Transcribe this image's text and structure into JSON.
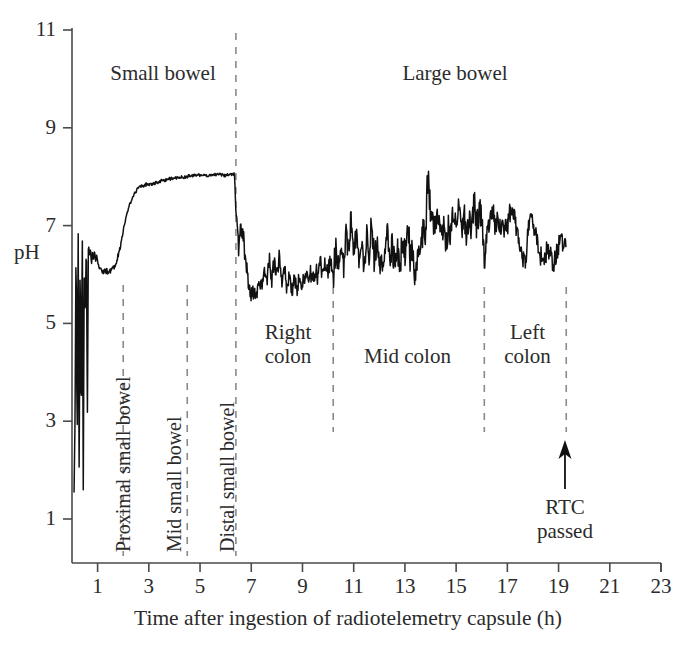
{
  "axes": {
    "y": {
      "label": "pH",
      "ticks": [
        1,
        3,
        5,
        7,
        9,
        11
      ],
      "min": 0.45,
      "max": 11.35
    },
    "x": {
      "label": "Time after ingestion of radiotelemetry capsule (h)",
      "ticks": [
        1,
        3,
        5,
        7,
        9,
        11,
        13,
        15,
        17,
        19,
        21,
        23
      ],
      "min": 0.0,
      "max": 23.0
    }
  },
  "top_regions": [
    {
      "name": "small-bowel",
      "label": "Small bowel"
    },
    {
      "name": "large-bowel",
      "label": "Large bowel"
    }
  ],
  "segment_labels": [
    {
      "name": "proximal-small-bowel",
      "label": "Proximal small bowel",
      "orientation": "vertical"
    },
    {
      "name": "mid-small-bowel",
      "label": "Mid small bowel",
      "orientation": "vertical"
    },
    {
      "name": "distal-small-bowel",
      "label": "Distal small bowel",
      "orientation": "vertical"
    },
    {
      "name": "right-colon",
      "label_line1": "Right",
      "label_line2": "colon",
      "orientation": "horizontal"
    },
    {
      "name": "mid-colon",
      "label_line1": "Mid colon",
      "label_line2": "",
      "orientation": "horizontal"
    },
    {
      "name": "left-colon",
      "label_line1": "Left",
      "label_line2": "colon",
      "orientation": "horizontal"
    }
  ],
  "annotation": {
    "name": "rtc-passed",
    "line1": "RTC",
    "line2": "passed",
    "arrow_at_hours": 19.25
  },
  "colors": {
    "background": "#ffffff",
    "trace": "#111111",
    "axis": "#4a4a4a",
    "divider": "#8a8a8a",
    "text": "#2b2b2b"
  },
  "chart_data": {
    "type": "line",
    "title": "",
    "xlabel": "Time after ingestion of radiotelemetry capsule (h)",
    "ylabel": "pH",
    "xlim": [
      0.0,
      23.0
    ],
    "ylim": [
      0.45,
      11.35
    ],
    "grid": false,
    "legend": null,
    "xticks": [
      1,
      3,
      5,
      7,
      9,
      11,
      13,
      15,
      17,
      19,
      21,
      23
    ],
    "yticks": [
      1,
      3,
      5,
      7,
      9,
      11
    ],
    "region_dividers_hours": [
      2.0,
      4.5,
      6.4,
      10.2,
      16.1,
      19.3
    ],
    "series": [
      {
        "name": "pH trace",
        "x": [
          0.08,
          0.12,
          0.16,
          0.2,
          0.24,
          0.28,
          0.32,
          0.36,
          0.4,
          0.44,
          0.48,
          0.52,
          0.56,
          0.6,
          0.64,
          0.68,
          0.72,
          0.76,
          0.8,
          0.84,
          0.88,
          0.92,
          0.96,
          1.0,
          1.1,
          1.2,
          1.3,
          1.4,
          1.5,
          1.6,
          1.7,
          1.8,
          1.9,
          2.0,
          2.1,
          2.2,
          2.3,
          2.4,
          2.5,
          2.6,
          2.7,
          2.8,
          2.9,
          3.0,
          3.2,
          3.4,
          3.6,
          3.8,
          4.0,
          4.2,
          4.4,
          4.6,
          4.8,
          5.0,
          5.2,
          5.4,
          5.6,
          5.8,
          6.0,
          6.2,
          6.35,
          6.4,
          6.45,
          6.5,
          6.6,
          6.7,
          6.8,
          6.9,
          7.0,
          7.1,
          7.2,
          7.3,
          7.4,
          7.5,
          7.6,
          7.7,
          7.8,
          7.9,
          8.0,
          8.1,
          8.2,
          8.3,
          8.4,
          8.5,
          8.6,
          8.7,
          8.8,
          8.9,
          9.0,
          9.1,
          9.2,
          9.3,
          9.4,
          9.5,
          9.6,
          9.7,
          9.8,
          9.9,
          10.0,
          10.1,
          10.2,
          10.3,
          10.4,
          10.5,
          10.6,
          10.7,
          10.8,
          10.9,
          11.0,
          11.1,
          11.2,
          11.3,
          11.4,
          11.5,
          11.6,
          11.7,
          11.8,
          11.9,
          12.0,
          12.1,
          12.2,
          12.3,
          12.4,
          12.5,
          12.6,
          12.7,
          12.8,
          12.9,
          13.0,
          13.1,
          13.2,
          13.3,
          13.4,
          13.5,
          13.6,
          13.7,
          13.8,
          13.9,
          14.0,
          14.1,
          14.2,
          14.3,
          14.4,
          14.5,
          14.6,
          14.7,
          14.8,
          14.9,
          15.0,
          15.1,
          15.2,
          15.3,
          15.4,
          15.5,
          15.6,
          15.7,
          15.8,
          15.9,
          16.0,
          16.1,
          16.2,
          16.3,
          16.4,
          16.5,
          16.6,
          16.7,
          16.8,
          16.9,
          17.0,
          17.1,
          17.2,
          17.3,
          17.4,
          17.5,
          17.6,
          17.7,
          17.8,
          17.9,
          18.0,
          18.1,
          18.2,
          18.3,
          18.4,
          18.5,
          18.6,
          18.7,
          18.8,
          18.9,
          19.0,
          19.1,
          19.2,
          19.3
        ],
        "y": [
          1.55,
          3.1,
          6.9,
          2.2,
          7.1,
          1.8,
          6.6,
          2.6,
          7.25,
          1.6,
          6.4,
          5.05,
          6.85,
          3.0,
          6.7,
          6.35,
          6.55,
          6.2,
          6.45,
          6.3,
          6.5,
          6.25,
          6.4,
          6.28,
          6.1,
          6.05,
          6.08,
          6.06,
          6.1,
          6.12,
          6.2,
          6.35,
          6.6,
          6.9,
          7.15,
          7.35,
          7.5,
          7.62,
          7.7,
          7.78,
          7.82,
          7.8,
          7.85,
          7.84,
          7.86,
          7.9,
          7.93,
          7.95,
          7.97,
          7.98,
          8.0,
          8.02,
          8.03,
          8.04,
          8.02,
          8.03,
          8.05,
          8.04,
          8.03,
          8.05,
          8.06,
          7.4,
          6.95,
          6.6,
          7.05,
          6.7,
          6.3,
          5.8,
          5.55,
          5.7,
          5.62,
          5.95,
          5.8,
          6.05,
          5.85,
          6.25,
          5.95,
          6.3,
          6.05,
          6.35,
          5.9,
          6.1,
          5.75,
          5.95,
          5.6,
          5.85,
          5.7,
          6.0,
          5.8,
          6.05,
          5.9,
          6.1,
          5.85,
          6.05,
          5.95,
          6.2,
          6.0,
          6.25,
          6.05,
          6.3,
          5.95,
          6.4,
          6.15,
          6.55,
          6.25,
          6.7,
          6.35,
          7.15,
          6.45,
          6.8,
          6.3,
          6.6,
          6.25,
          6.85,
          6.4,
          6.9,
          6.3,
          6.55,
          6.2,
          6.5,
          6.25,
          6.95,
          6.35,
          6.6,
          6.2,
          6.45,
          6.15,
          6.6,
          6.3,
          7.05,
          6.4,
          6.55,
          5.9,
          6.25,
          6.5,
          7.0,
          6.7,
          8.2,
          7.3,
          7.05,
          6.95,
          7.25,
          6.75,
          7.0,
          6.6,
          6.95,
          6.8,
          7.2,
          6.9,
          7.35,
          7.0,
          7.25,
          6.85,
          7.1,
          6.95,
          7.4,
          7.1,
          7.3,
          7.05,
          6.2,
          6.85,
          7.1,
          7.3,
          7.05,
          7.2,
          6.9,
          7.05,
          6.8,
          7.0,
          7.35,
          7.3,
          7.15,
          6.85,
          6.55,
          6.35,
          6.25,
          6.9,
          7.3,
          7.1,
          6.85,
          6.6,
          6.4,
          6.2,
          6.45,
          6.55,
          6.35,
          6.25,
          6.4,
          6.6,
          6.7,
          6.55,
          6.7
        ]
      }
    ]
  }
}
